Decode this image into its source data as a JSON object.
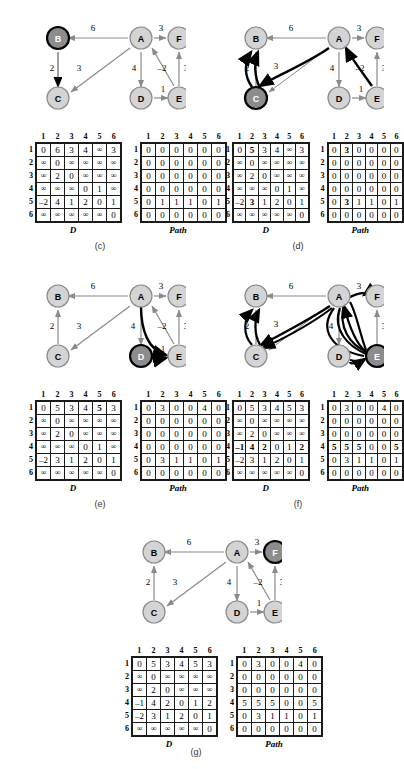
{
  "figure": {
    "node_labels": [
      "A",
      "B",
      "C",
      "D",
      "E",
      "F"
    ],
    "matrix_headers": [
      "1",
      "2",
      "3",
      "4",
      "5",
      "6"
    ],
    "row_headers": [
      "1",
      "2",
      "3",
      "4",
      "5",
      "6"
    ],
    "d_label": "D",
    "path_label": "Path",
    "infinity": "∞",
    "colors": {
      "node_fill": "#d4d4d4",
      "node_stroke": "#8a8a8a",
      "active_node_fill": "#8c8c8c",
      "active_node_stroke": "#000000",
      "edge": "#8a8a8a",
      "highlight_edge": "#000000",
      "cell_border": "#1a1a1a"
    },
    "edges": [
      {
        "from": "A",
        "to": "B",
        "weight": "6"
      },
      {
        "from": "A",
        "to": "F",
        "weight": "3"
      },
      {
        "from": "A",
        "to": "C",
        "weight": "3"
      },
      {
        "from": "A",
        "to": "D",
        "weight": "4"
      },
      {
        "from": "B",
        "to": "C",
        "weight": "2"
      },
      {
        "from": "D",
        "to": "E",
        "weight": "1"
      },
      {
        "from": "E",
        "to": "A",
        "weight": "-2"
      },
      {
        "from": "E",
        "to": "F",
        "weight": "3"
      }
    ]
  },
  "panels": [
    {
      "id": "c",
      "caption": "(c)",
      "active_node": "B",
      "D": [
        [
          "0",
          "6",
          "3",
          "4",
          "∞",
          "3"
        ],
        [
          "∞",
          "0",
          "∞",
          "∞",
          "∞",
          "∞"
        ],
        [
          "∞",
          "2",
          "0",
          "∞",
          "∞",
          "∞"
        ],
        [
          "∞",
          "∞",
          "∞",
          "0",
          "1",
          "∞"
        ],
        [
          "–2",
          "4",
          "1",
          "2",
          "0",
          "1"
        ],
        [
          "∞",
          "∞",
          "∞",
          "∞",
          "∞",
          "0"
        ]
      ],
      "D_bold": [],
      "Path": [
        [
          "0",
          "0",
          "0",
          "0",
          "0",
          "0"
        ],
        [
          "0",
          "0",
          "0",
          "0",
          "0",
          "0"
        ],
        [
          "0",
          "0",
          "0",
          "0",
          "0",
          "0"
        ],
        [
          "0",
          "0",
          "0",
          "0",
          "0",
          "0"
        ],
        [
          "0",
          "1",
          "1",
          "1",
          "0",
          "1"
        ],
        [
          "0",
          "0",
          "0",
          "0",
          "0",
          "0"
        ]
      ],
      "Path_bold": []
    },
    {
      "id": "d",
      "caption": "(d)",
      "active_node": "C",
      "D": [
        [
          "0",
          "5",
          "3",
          "4",
          "∞",
          "3"
        ],
        [
          "∞",
          "0",
          "∞",
          "∞",
          "∞",
          "∞"
        ],
        [
          "∞",
          "2",
          "0",
          "∞",
          "∞",
          "∞"
        ],
        [
          "∞",
          "∞",
          "∞",
          "0",
          "1",
          "∞"
        ],
        [
          "–2",
          "3",
          "1",
          "2",
          "0",
          "1"
        ],
        [
          "∞",
          "∞",
          "∞",
          "∞",
          "∞",
          "0"
        ]
      ],
      "D_bold": [
        [
          0,
          1
        ],
        [
          4,
          1
        ]
      ],
      "Path": [
        [
          "0",
          "3",
          "0",
          "0",
          "0",
          "0"
        ],
        [
          "0",
          "0",
          "0",
          "0",
          "0",
          "0"
        ],
        [
          "0",
          "0",
          "0",
          "0",
          "0",
          "0"
        ],
        [
          "0",
          "0",
          "0",
          "0",
          "0",
          "0"
        ],
        [
          "0",
          "3",
          "1",
          "1",
          "0",
          "1"
        ],
        [
          "0",
          "0",
          "0",
          "0",
          "0",
          "0"
        ]
      ],
      "Path_bold": [
        [
          0,
          1
        ],
        [
          4,
          1
        ]
      ]
    },
    {
      "id": "e",
      "caption": "(e)",
      "active_node": "D",
      "D": [
        [
          "0",
          "5",
          "3",
          "4",
          "5",
          "3"
        ],
        [
          "∞",
          "0",
          "∞",
          "∞",
          "∞",
          "∞"
        ],
        [
          "∞",
          "2",
          "0",
          "∞",
          "∞",
          "∞"
        ],
        [
          "∞",
          "∞",
          "∞",
          "0",
          "1",
          "∞"
        ],
        [
          "–2",
          "3",
          "1",
          "2",
          "0",
          "1"
        ],
        [
          "∞",
          "∞",
          "∞",
          "∞",
          "∞",
          "0"
        ]
      ],
      "D_bold": [
        [
          0,
          4
        ]
      ],
      "Path": [
        [
          "0",
          "3",
          "0",
          "0",
          "4",
          "0"
        ],
        [
          "0",
          "0",
          "0",
          "0",
          "0",
          "0"
        ],
        [
          "0",
          "0",
          "0",
          "0",
          "0",
          "0"
        ],
        [
          "0",
          "0",
          "0",
          "0",
          "0",
          "0"
        ],
        [
          "0",
          "3",
          "1",
          "1",
          "0",
          "1"
        ],
        [
          "0",
          "0",
          "0",
          "0",
          "0",
          "0"
        ]
      ],
      "Path_bold": []
    },
    {
      "id": "f",
      "caption": "(f)",
      "active_node": "E",
      "D": [
        [
          "0",
          "5",
          "3",
          "4",
          "5",
          "3"
        ],
        [
          "∞",
          "0",
          "∞",
          "∞",
          "∞",
          "∞"
        ],
        [
          "∞",
          "2",
          "0",
          "∞",
          "∞",
          "∞"
        ],
        [
          "–1",
          "4",
          "2",
          "0",
          "1",
          "2"
        ],
        [
          "–2",
          "3",
          "1",
          "2",
          "0",
          "1"
        ],
        [
          "∞",
          "∞",
          "∞",
          "∞",
          "∞",
          "0"
        ]
      ],
      "D_bold": [
        [
          3,
          0
        ],
        [
          3,
          1
        ],
        [
          3,
          2
        ],
        [
          3,
          5
        ]
      ],
      "Path": [
        [
          "0",
          "3",
          "0",
          "0",
          "4",
          "0"
        ],
        [
          "0",
          "0",
          "0",
          "0",
          "0",
          "0"
        ],
        [
          "0",
          "0",
          "0",
          "0",
          "0",
          "0"
        ],
        [
          "5",
          "5",
          "5",
          "0",
          "0",
          "5"
        ],
        [
          "0",
          "3",
          "1",
          "1",
          "0",
          "1"
        ],
        [
          "0",
          "0",
          "0",
          "0",
          "0",
          "0"
        ]
      ],
      "Path_bold": [
        [
          3,
          0
        ],
        [
          3,
          1
        ],
        [
          3,
          2
        ],
        [
          3,
          5
        ]
      ]
    },
    {
      "id": "g",
      "caption": "(g)",
      "active_node": "F",
      "D": [
        [
          "0",
          "5",
          "3",
          "4",
          "5",
          "3"
        ],
        [
          "∞",
          "0",
          "∞",
          "∞",
          "∞",
          "∞"
        ],
        [
          "∞",
          "2",
          "0",
          "∞",
          "∞",
          "∞"
        ],
        [
          "–1",
          "4",
          "2",
          "0",
          "1",
          "2"
        ],
        [
          "–2",
          "3",
          "1",
          "2",
          "0",
          "1"
        ],
        [
          "∞",
          "∞",
          "∞",
          "∞",
          "∞",
          "0"
        ]
      ],
      "D_bold": [],
      "Path": [
        [
          "0",
          "3",
          "0",
          "0",
          "4",
          "0"
        ],
        [
          "0",
          "0",
          "0",
          "0",
          "0",
          "0"
        ],
        [
          "0",
          "0",
          "0",
          "0",
          "0",
          "0"
        ],
        [
          "5",
          "5",
          "5",
          "0",
          "0",
          "5"
        ],
        [
          "0",
          "3",
          "1",
          "1",
          "0",
          "1"
        ],
        [
          "0",
          "0",
          "0",
          "0",
          "0",
          "0"
        ]
      ],
      "Path_bold": []
    }
  ]
}
